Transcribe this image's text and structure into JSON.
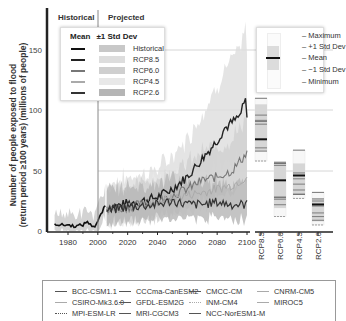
{
  "chart_data": {
    "type": "line",
    "title": "",
    "ylabel": "Number of people exposed to flood (return period ≥100 years) (millions of people)",
    "ylabel_line1": "Number of people exposed to flood",
    "ylabel_line2": "(return period ≥100 years) (millions of people)",
    "xlabel": "",
    "xlim": [
      1971,
      2100
    ],
    "ylim": [
      0,
      170
    ],
    "xticks": [
      "1980",
      "2000",
      "2020",
      "2040",
      "2060",
      "2080",
      "2100"
    ],
    "yticks": [
      "0",
      "50",
      "100",
      "150"
    ],
    "grid": "horizontal",
    "period_labels": {
      "historical": "Historical",
      "projected": "Projected",
      "divider_year": 2005
    },
    "legend": {
      "mean_header": "Mean",
      "std_header": "±1 Std Dev",
      "entries": [
        "Historical",
        "RCP8.5",
        "RCP6.0",
        "RCP4.5",
        "RCP2.6"
      ]
    },
    "series": [
      {
        "name": "Historical",
        "x": [
          1971,
          1975,
          1980,
          1985,
          1990,
          1993,
          1995,
          1998,
          2000,
          2003,
          2005
        ],
        "values": [
          6,
          5,
          5,
          4,
          5,
          8,
          5,
          4,
          8,
          16,
          21
        ]
      },
      {
        "name": "RCP8.5",
        "x": [
          2006,
          2010,
          2020,
          2030,
          2040,
          2050,
          2060,
          2070,
          2080,
          2085,
          2090,
          2095,
          2099,
          2100
        ],
        "values": [
          18,
          20,
          23,
          25,
          28,
          35,
          45,
          60,
          75,
          85,
          90,
          95,
          108,
          94
        ]
      },
      {
        "name": "RCP6.0",
        "x": [
          2006,
          2020,
          2040,
          2060,
          2070,
          2080,
          2090,
          2100
        ],
        "values": [
          17,
          20,
          24,
          35,
          42,
          45,
          50,
          65
        ]
      },
      {
        "name": "RCP4.5",
        "x": [
          2006,
          2020,
          2040,
          2060,
          2070,
          2080,
          2090,
          2100
        ],
        "values": [
          17,
          20,
          24,
          30,
          32,
          35,
          38,
          45
        ]
      },
      {
        "name": "RCP2.6",
        "x": [
          2006,
          2020,
          2040,
          2050,
          2060,
          2070,
          2080,
          2090,
          2100
        ],
        "values": [
          17,
          20,
          22,
          25,
          22,
          22,
          24,
          22,
          22
        ]
      }
    ],
    "boxplots": {
      "categories": [
        "RCP8.5",
        "RCP6.0",
        "RCP4.5",
        "RCP2.6"
      ],
      "minimum": [
        58,
        12,
        27,
        5
      ],
      "minus_1sd": [
        66,
        19,
        30,
        8
      ],
      "mean": [
        76,
        42,
        46,
        22
      ],
      "plus_1sd": [
        105,
        58,
        56,
        27
      ],
      "maximum": [
        110,
        56,
        67,
        32
      ],
      "legend": [
        "Maximum",
        "+1 Std Dev",
        "Mean",
        "−1 Std Dev",
        "Minimum"
      ]
    },
    "models": [
      "BCC-CSM1.1",
      "CCCma-CanESM2",
      "CMCC-CM",
      "CNRM-CM5",
      "CSIRO-Mk3.6.0",
      "GFDL-ESM2G",
      "INM-CM4",
      "MIROC5",
      "MPI-ESM-LR",
      "MRI-CGCM3",
      "NCC-NorESM1-M"
    ]
  },
  "colors": {
    "historical": "#111111",
    "rcp85": "#222222",
    "rcp60": "#777777",
    "rcp45": "#aaaaaa",
    "rcp26": "#333333",
    "band_hist": "#c8c8c8",
    "band_85": "#dddddd",
    "band_60": "#cfcfcf",
    "band_45": "#e8e8e8",
    "band_26": "#b5b5b5"
  }
}
